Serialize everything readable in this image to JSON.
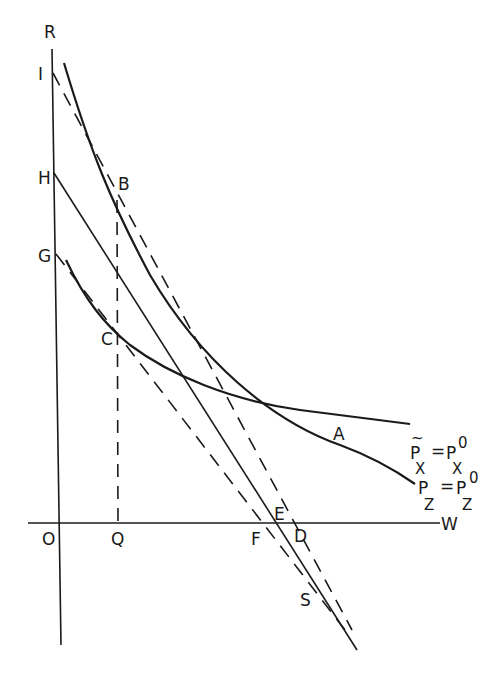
{
  "diagram": {
    "type": "economics-curve-diagram",
    "axes": {
      "vertical": "R",
      "horizontal": "W",
      "origin": "O"
    },
    "points": {
      "vertical_intercepts": [
        "I",
        "H",
        "G"
      ],
      "horizontal_intercepts": [
        "Q",
        "F",
        "E",
        "D"
      ],
      "tangency": [
        "B",
        "C"
      ],
      "intersection": "A",
      "convergence": "S"
    },
    "labels": {
      "R": "R",
      "I": "I",
      "H": "H",
      "G": "G",
      "B": "B",
      "C": "C",
      "A": "A",
      "O": "O",
      "Q": "Q",
      "F": "F",
      "E": "E",
      "D": "D",
      "W": "W",
      "S": "S"
    },
    "curve_labels": {
      "px_main": "P",
      "px_tilde": "~",
      "px_sub": "X",
      "px_eq": "=",
      "px_rhs": "P",
      "px_rhs_sub": "X",
      "px_rhs_sup": "0",
      "pz_main": "P",
      "pz_sub": "Z",
      "pz_eq": "=",
      "pz_rhs": "P",
      "pz_rhs_sub": "Z",
      "pz_rhs_sup": "0"
    },
    "curves": [
      {
        "name": "Pz = Pz0",
        "style": "solid-heavy",
        "description": "upper convex curve through B and A"
      },
      {
        "name": "~Px = Px0",
        "style": "solid-heavy",
        "description": "lower convex curve through C and A"
      }
    ],
    "lines": [
      {
        "from": "I",
        "to": "S",
        "style": "dashed",
        "tangent_at": "B"
      },
      {
        "from": "G",
        "to": "S",
        "style": "dashed",
        "tangent_at": "C"
      },
      {
        "from": "H",
        "to": "S",
        "style": "solid"
      },
      {
        "from": "B",
        "to": "Q",
        "style": "dashed-vertical"
      }
    ]
  }
}
